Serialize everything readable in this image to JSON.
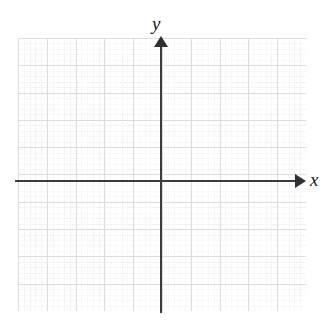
{
  "figure": {
    "type": "coordinate-plane",
    "background_color": "#ffffff",
    "width": 329,
    "height": 330
  },
  "axes": {
    "x": {
      "label": "x",
      "arrow": "right",
      "color": "#3a3a3f",
      "icon": "arrow-right-icon"
    },
    "y": {
      "label": "y",
      "arrow": "up",
      "color": "#3a3a3f",
      "icon": "arrow-up-icon"
    },
    "origin": {
      "x": 161,
      "y": 181
    },
    "tick_labels": [],
    "numbers_shown": false
  },
  "grid": {
    "major_color": "#dcdcdc",
    "minor_color": "#f0f0f0",
    "major_columns": 10,
    "major_rows": 10,
    "minor_per_major": 5,
    "left": 18,
    "top": 38,
    "width": 288,
    "height": 273,
    "style": "dotted"
  },
  "chart_data": {
    "type": "scatter",
    "title": "",
    "subtitle": "",
    "xlabel": "x",
    "ylabel": "y",
    "x": [],
    "y": [],
    "series": [],
    "annotations": [],
    "legend": [],
    "legend_position": "none",
    "grid": true,
    "xlim": [
      -5,
      5
    ],
    "ylim": [
      -5,
      5
    ],
    "xticks": [],
    "yticks": [],
    "note": "Empty coordinate plane — no data points, curves, or tick numbers are plotted."
  }
}
